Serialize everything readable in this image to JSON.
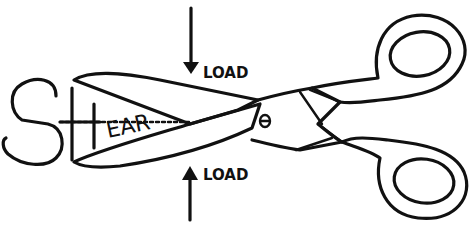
{
  "diagram": {
    "title_word": "SHEAR",
    "letters": {
      "s": "S",
      "h": "H",
      "ear": "EAR"
    },
    "load_top": "LOAD",
    "load_bottom": "LOAD",
    "ink_color": "#111111",
    "background": "#ffffff"
  }
}
